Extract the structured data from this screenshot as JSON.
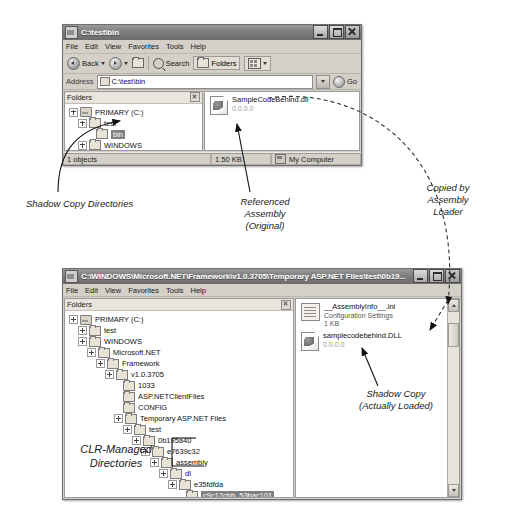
{
  "window_top": {
    "title": "C:\\test\\bin",
    "menu": [
      "File",
      "Edit",
      "View",
      "Favorites",
      "Tools",
      "Help"
    ],
    "toolbar": {
      "back_label": "Back",
      "search_label": "Search",
      "folders_label": "Folders",
      "views_icon": "views-icon"
    },
    "address": {
      "label": "Address",
      "value": "C:\\test\\bin",
      "go_label": "Go"
    },
    "folders_pane_title": "Folders",
    "tree": [
      {
        "label": "PRIMARY (C:)",
        "depth": 0,
        "expander": "plus",
        "icon": "drive-icon",
        "selected": false
      },
      {
        "label": "test",
        "depth": 1,
        "expander": "plus",
        "icon": "folder-icon",
        "selected": false
      },
      {
        "label": "bin",
        "depth": 2,
        "expander": "none",
        "icon": "folder-icon",
        "selected": true
      },
      {
        "label": "WINDOWS",
        "depth": 1,
        "expander": "plus",
        "icon": "folder-icon",
        "selected": false
      }
    ],
    "files": [
      {
        "name": "SampleCodeBehind.dll",
        "sub": "0.0.0.0",
        "icon": "dll-icon"
      }
    ],
    "status": {
      "objects": "1 objects",
      "size": "1.50 KB",
      "location": "My Computer"
    }
  },
  "window_bottom": {
    "title": "C:\\WINDOWS\\Microsoft.NET\\Framework\\v1.0.3705\\Temporary ASP.NET Files\\test\\0b19...",
    "menu": [
      "File",
      "Edit",
      "View",
      "Favorites",
      "Tools",
      "Help"
    ],
    "folders_pane_title": "Folders",
    "tree": [
      {
        "label": "PRIMARY (C:)",
        "depth": 0,
        "expander": "plus",
        "icon": "drive-icon",
        "selected": false
      },
      {
        "label": "test",
        "depth": 1,
        "expander": "plus",
        "icon": "folder-icon",
        "selected": false
      },
      {
        "label": "WINDOWS",
        "depth": 1,
        "expander": "plus",
        "icon": "folder-icon",
        "selected": false
      },
      {
        "label": "Microsoft.NET",
        "depth": 2,
        "expander": "plus",
        "icon": "folder-icon",
        "selected": false
      },
      {
        "label": "Framework",
        "depth": 3,
        "expander": "plus",
        "icon": "folder-icon",
        "selected": false
      },
      {
        "label": "v1.0.3705",
        "depth": 4,
        "expander": "plus",
        "icon": "folder-icon",
        "selected": false
      },
      {
        "label": "1033",
        "depth": 5,
        "expander": "none",
        "icon": "folder-icon",
        "selected": false
      },
      {
        "label": "ASP.NETClientFiles",
        "depth": 5,
        "expander": "none",
        "icon": "folder-icon",
        "selected": false
      },
      {
        "label": "CONFIG",
        "depth": 5,
        "expander": "none",
        "icon": "folder-icon",
        "selected": false
      },
      {
        "label": "Temporary ASP.NET Files",
        "depth": 5,
        "expander": "plus",
        "icon": "folder-icon",
        "selected": false
      },
      {
        "label": "test",
        "depth": 6,
        "expander": "plus",
        "icon": "folder-icon",
        "selected": false
      },
      {
        "label": "0b195a40",
        "depth": 7,
        "expander": "plus",
        "icon": "folder-icon",
        "selected": false
      },
      {
        "label": "e7639c32",
        "depth": 8,
        "expander": "plus",
        "icon": "folder-icon",
        "selected": false
      },
      {
        "label": "assembly",
        "depth": 9,
        "expander": "plus",
        "icon": "folder-icon",
        "selected": false
      },
      {
        "label": "dl",
        "depth": 10,
        "expander": "plus",
        "icon": "folder-icon",
        "selected": false
      },
      {
        "label": "e35fdfda",
        "depth": 11,
        "expander": "plus",
        "icon": "folder-icon",
        "selected": false
      },
      {
        "label": "c9c17cbb_53bac101",
        "depth": 12,
        "expander": "none",
        "icon": "folder-icon",
        "selected": true
      }
    ],
    "files": [
      {
        "name": "__AssemblyInfo__.ini",
        "sub": "Configuration Settings",
        "sub2": "1 KB",
        "icon": "ini-icon"
      },
      {
        "name": "samplecodebehind.DLL",
        "sub": "0.0.0.0",
        "sub2": "",
        "icon": "dll-icon"
      }
    ]
  },
  "annotations": {
    "shadow_copy_directories": "Shadow Copy Directories",
    "referenced_assembly": "Referenced\nAssembly\n(Original)",
    "copied_by_loader": "Copied by\nAssembly\nLoader",
    "clr_managed": "CLR-Managed\nDirectories",
    "shadow_copy_loaded": "Shadow Copy\n(Actually Loaded)"
  }
}
